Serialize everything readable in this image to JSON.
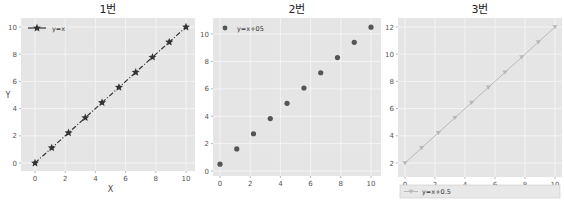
{
  "colors": {
    "panel_bg": "#e5e5e5",
    "grid": "#f5f5f5",
    "series1": "#333333",
    "series2": "#555555",
    "series3": "#b8b8b8",
    "legend3_bg": "#e8e8e8"
  },
  "chart_data": [
    {
      "type": "line",
      "title": "1번",
      "xlabel": "X",
      "ylabel": "Y",
      "xlim": [
        0,
        10
      ],
      "ylim": [
        0,
        10
      ],
      "xticks": [
        0,
        2,
        4,
        6,
        8,
        10
      ],
      "yticks": [
        0,
        2,
        4,
        6,
        8,
        10
      ],
      "grid": true,
      "legend_position": "upper left",
      "series": [
        {
          "name": "y=x",
          "style": "dash-dot line with star markers",
          "x": [
            0,
            1.11,
            2.22,
            3.33,
            4.44,
            5.56,
            6.67,
            7.78,
            8.89,
            10
          ],
          "y": [
            0,
            1.11,
            2.22,
            3.33,
            4.44,
            5.56,
            6.67,
            7.78,
            8.89,
            10
          ]
        }
      ]
    },
    {
      "type": "scatter",
      "title": "2번",
      "xlabel": "",
      "ylabel": "",
      "xlim": [
        0,
        10
      ],
      "ylim": [
        0,
        10.5
      ],
      "xticks": [
        0,
        2,
        4,
        6,
        8,
        10
      ],
      "yticks": [
        0,
        2,
        4,
        6,
        8,
        10
      ],
      "grid": true,
      "legend_position": "upper left",
      "series": [
        {
          "name": "y=x+05",
          "style": "circle markers",
          "x": [
            0,
            1.11,
            2.22,
            3.33,
            4.44,
            5.56,
            6.67,
            7.78,
            8.89,
            10
          ],
          "y": [
            0.5,
            1.61,
            2.72,
            3.83,
            4.94,
            6.06,
            7.17,
            8.28,
            9.39,
            10.5
          ]
        }
      ]
    },
    {
      "type": "line",
      "title": "3번",
      "xlabel": "",
      "ylabel": "",
      "xlim": [
        0,
        10
      ],
      "ylim": [
        2,
        12
      ],
      "xticks": [
        0,
        2,
        4,
        6,
        8,
        10
      ],
      "yticks": [
        2,
        4,
        6,
        8,
        10,
        12
      ],
      "grid": true,
      "legend_position": "below plot",
      "series": [
        {
          "name": "y=x+0.5",
          "style": "light solid line with triangle markers",
          "x": [
            0,
            1.11,
            2.22,
            3.33,
            4.44,
            5.56,
            6.67,
            7.78,
            8.89,
            10
          ],
          "y": [
            2,
            3.11,
            4.22,
            5.33,
            6.44,
            7.56,
            8.67,
            9.78,
            10.89,
            12
          ]
        }
      ]
    }
  ]
}
